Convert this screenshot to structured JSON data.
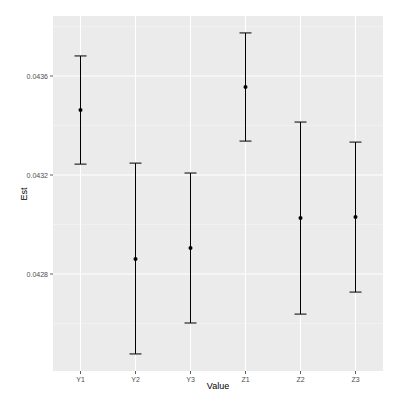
{
  "chart_data": {
    "type": "errorbar",
    "title": "",
    "xlabel": "Value",
    "ylabel": "Est",
    "categories": [
      "Y1",
      "Y2",
      "Y3",
      "Z1",
      "Z2",
      "Z3"
    ],
    "values": [
      0.043463,
      0.042861,
      0.042905,
      0.043556,
      0.043026,
      0.04303
    ],
    "lower": [
      0.043244,
      0.042477,
      0.042602,
      0.043337,
      0.042638,
      0.042727
    ],
    "upper": [
      0.043681,
      0.043248,
      0.043208,
      0.043774,
      0.043414,
      0.043333
    ],
    "yticks": [
      0.0428,
      0.0432,
      0.0436
    ],
    "ytick_labels": [
      "0.0428",
      "0.0432",
      "0.0436"
    ],
    "ylim": [
      0.04245,
      0.04382
    ],
    "grid": true,
    "legend": null
  },
  "style": {
    "panel_bg": "#ebebeb",
    "grid_major": "#ffffff",
    "grid_minor": "#f5f5f5",
    "point_color": "#000000",
    "errorbar_color": "#000000"
  }
}
